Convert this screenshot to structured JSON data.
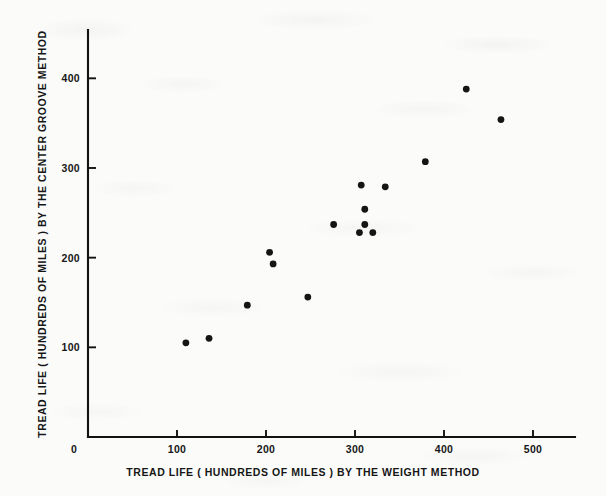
{
  "chart_data": {
    "type": "scatter",
    "title": "",
    "xlabel": "TREAD LIFE ( HUNDREDS OF MILES ) BY THE WEIGHT METHOD",
    "ylabel": "TREAD LIFE ( HUNDREDS OF MILES ) BY THE CENTER GROOVE METHOD",
    "xlim": [
      0,
      548
    ],
    "ylim": [
      0,
      438
    ],
    "xticks": [
      0,
      100,
      200,
      300,
      400,
      500
    ],
    "xticklabels": [
      "0",
      "100",
      "200",
      "300",
      "400",
      "500"
    ],
    "yticks": [
      100,
      200,
      300,
      400
    ],
    "yticklabels": [
      "100",
      "200",
      "300",
      "400"
    ],
    "grid": false,
    "legend": false,
    "marker": "filled-circle",
    "marker_color": "#151515",
    "points": [
      {
        "x": 110,
        "y": 105
      },
      {
        "x": 136,
        "y": 110
      },
      {
        "x": 179,
        "y": 147
      },
      {
        "x": 204,
        "y": 206
      },
      {
        "x": 208,
        "y": 193
      },
      {
        "x": 247,
        "y": 156
      },
      {
        "x": 276,
        "y": 237
      },
      {
        "x": 305,
        "y": 228
      },
      {
        "x": 307,
        "y": 281
      },
      {
        "x": 311,
        "y": 254
      },
      {
        "x": 311,
        "y": 237
      },
      {
        "x": 320,
        "y": 228
      },
      {
        "x": 334,
        "y": 279
      },
      {
        "x": 379,
        "y": 307
      },
      {
        "x": 425,
        "y": 388
      },
      {
        "x": 464,
        "y": 354
      }
    ]
  },
  "colors": {
    "paper": "#fbfbfa",
    "ink": "#151515",
    "axis": "#121212"
  }
}
